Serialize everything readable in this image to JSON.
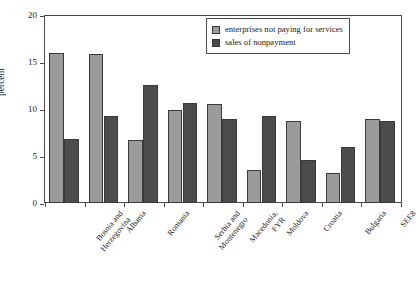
{
  "chart_data": {
    "type": "bar",
    "title": "",
    "xlabel": "",
    "ylabel": "percent",
    "ylim": [
      0,
      20
    ],
    "yticks": [
      0,
      5,
      10,
      15,
      20
    ],
    "ytick_labels": [
      "0",
      "5",
      "10",
      "15",
      "20"
    ],
    "grid": false,
    "legend_position": "top-right",
    "categories": [
      "Bosnia and\nHerzegovina",
      "Albania",
      "Romania",
      "Serbia and\nMontenegro",
      "Macedonia,\nFYR",
      "Moldova",
      "Croatia",
      "Bulgaria",
      "SEE8"
    ],
    "series": [
      {
        "name": "enterprises not paying for services",
        "color": "#9b9b9b",
        "values": [
          16.0,
          15.9,
          6.7,
          9.9,
          10.5,
          3.5,
          8.7,
          3.2,
          8.9
        ]
      },
      {
        "name": "sales of nonpayment",
        "color": "#4c4c4c",
        "values": [
          6.8,
          9.3,
          12.6,
          10.6,
          8.9,
          9.3,
          4.6,
          6.0,
          8.7
        ]
      }
    ]
  },
  "axes": {
    "y_title": "percent"
  },
  "legend": {
    "items": [
      {
        "label": "enterprises not paying for services",
        "swatch": "light"
      },
      {
        "label": "sales of nonpayment",
        "swatch": "dark"
      }
    ]
  }
}
